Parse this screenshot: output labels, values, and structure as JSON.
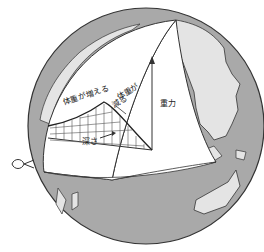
{
  "diagram": {
    "labels": {
      "weight_increases": "体重が増える",
      "weight_decreases_line1": "体重が",
      "weight_decreases_line2": "減る",
      "gravity": "重力",
      "depth": "深さ"
    },
    "colors": {
      "ocean": "#a9a9a9",
      "land": "#e4e4e4",
      "cut_face": "#ffffff",
      "outline": "#333333",
      "grid": "#555555"
    }
  }
}
